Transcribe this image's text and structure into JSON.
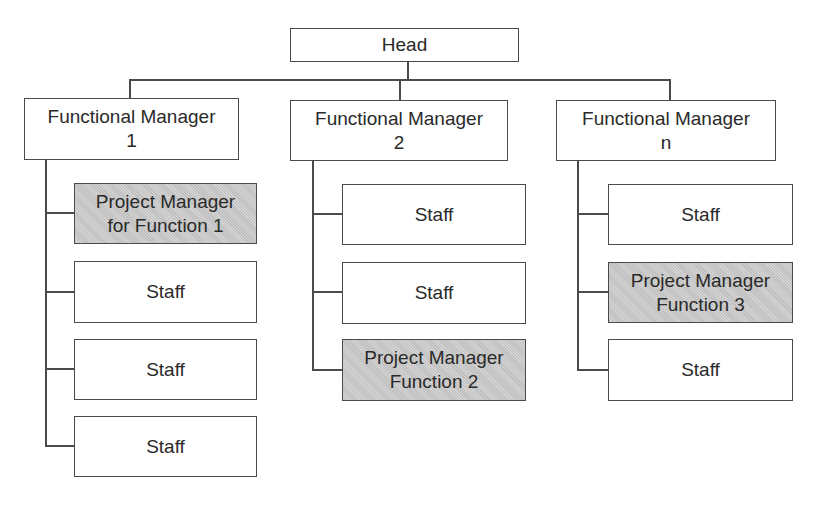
{
  "chart": {
    "head": {
      "label": "Head"
    },
    "managers": [
      {
        "label": "Functional Manager\n1",
        "children": [
          {
            "label": "Project Manager\nfor Function 1",
            "highlighted": true
          },
          {
            "label": "Staff",
            "highlighted": false
          },
          {
            "label": "Staff",
            "highlighted": false
          },
          {
            "label": "Staff",
            "highlighted": false
          }
        ]
      },
      {
        "label": "Functional Manager\n2",
        "children": [
          {
            "label": "Staff",
            "highlighted": false
          },
          {
            "label": "Staff",
            "highlighted": false
          },
          {
            "label": "Project Manager\nFunction 2",
            "highlighted": true
          }
        ]
      },
      {
        "label": "Functional Manager\nn",
        "children": [
          {
            "label": "Staff",
            "highlighted": false
          },
          {
            "label": "Project Manager\nFunction 3",
            "highlighted": true
          },
          {
            "label": "Staff",
            "highlighted": false
          }
        ]
      }
    ]
  },
  "colors": {
    "line": "#4a4a4a",
    "highlight_fill": "#c9c9c9",
    "box_fill": "#ffffff"
  }
}
